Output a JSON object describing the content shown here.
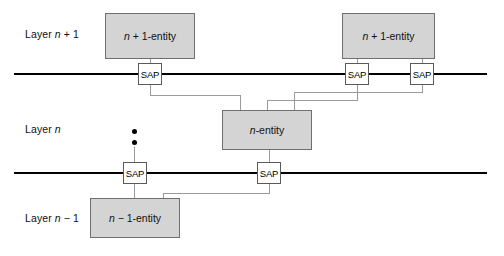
{
  "figure": {
    "type": "layer-diagram",
    "width": 504,
    "height": 256,
    "background_color": "#ffffff"
  },
  "colors": {
    "entity_fill": "#d4d4d4",
    "entity_stroke": "#6f6f6f",
    "entity_shadow": "#000000",
    "sap_fill": "#ffffff",
    "sap_stroke": "#5a5a5a",
    "layer_line": "#000000",
    "connector_line": "#9a9a9a",
    "text": "#111111"
  },
  "layers": [
    {
      "id": "layer-n-plus-1",
      "label_prefix": "Layer ",
      "label_symbol": "n",
      "label_suffix": " + 1",
      "label_text": "Layer n + 1",
      "line_y": 74
    },
    {
      "id": "layer-n",
      "label_prefix": "Layer ",
      "label_symbol": "n",
      "label_suffix": "",
      "label_text": "Layer n",
      "line_y": 173
    },
    {
      "id": "layer-n-minus-1",
      "label_prefix": "Layer ",
      "label_symbol": "n",
      "label_suffix": " − 1",
      "label_text": "Layer n − 1",
      "line_y": null
    }
  ],
  "entities": [
    {
      "id": "entity-n-plus-1-left",
      "prefix": "n",
      "suffix": " + 1-entity",
      "text": "n + 1-entity",
      "x": 105,
      "y": 13,
      "w": 90,
      "h": 46
    },
    {
      "id": "entity-n-plus-1-right",
      "prefix": "n",
      "suffix": " + 1-entity",
      "text": "n + 1-entity",
      "x": 342,
      "y": 13,
      "w": 93,
      "h": 46
    },
    {
      "id": "entity-n",
      "prefix": "n",
      "suffix": "-entity",
      "text": "n-entity",
      "x": 222,
      "y": 110,
      "w": 90,
      "h": 40
    },
    {
      "id": "entity-n-minus-1",
      "prefix": "n",
      "suffix": " − 1-entity",
      "text": "n − 1-entity",
      "x": 90,
      "y": 198,
      "w": 90,
      "h": 40
    }
  ],
  "sap_label": "SAP",
  "saps": [
    {
      "id": "sap-upper-1",
      "label": "SAP",
      "x": 138,
      "y": 63,
      "w": 24,
      "h": 22
    },
    {
      "id": "sap-upper-2",
      "label": "SAP",
      "x": 345,
      "y": 63,
      "w": 24,
      "h": 22
    },
    {
      "id": "sap-upper-3",
      "label": "SAP",
      "x": 410,
      "y": 63,
      "w": 24,
      "h": 22
    },
    {
      "id": "sap-lower-1",
      "label": "SAP",
      "x": 123,
      "y": 162,
      "w": 24,
      "h": 22
    },
    {
      "id": "sap-lower-2",
      "label": "SAP",
      "x": 257,
      "y": 162,
      "w": 24,
      "h": 22
    }
  ],
  "layer_lines": [
    {
      "id": "layer-line-upper",
      "x1": 14,
      "x2": 487,
      "y": 74
    },
    {
      "id": "layer-line-lower",
      "x1": 14,
      "x2": 487,
      "y": 173
    }
  ],
  "vertical_dots": [
    {
      "id": "continuation-dot-1",
      "cx": 134,
      "cy": 131
    },
    {
      "id": "continuation-dot-2",
      "cx": 134,
      "cy": 142
    }
  ],
  "labels": {
    "layer_top": "Layer n + 1",
    "layer_mid": "Layer n",
    "layer_bottom": "Layer n − 1"
  }
}
